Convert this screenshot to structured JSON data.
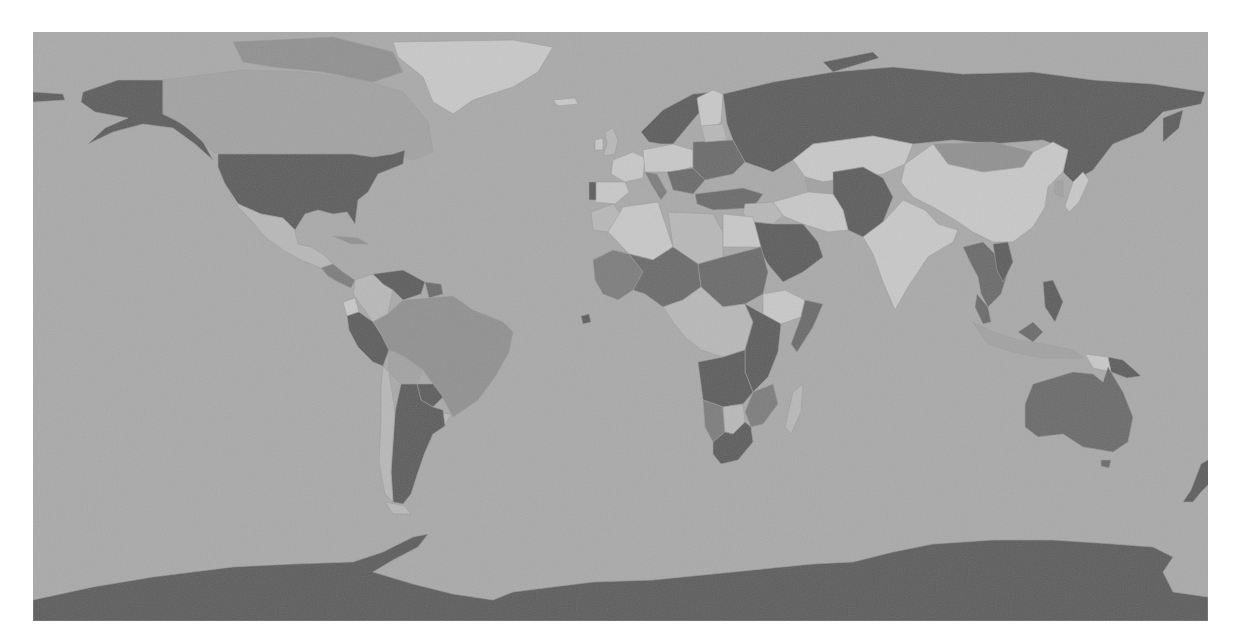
{
  "map": {
    "type": "choropleth",
    "projection": "equirectangular",
    "style": "grayscale",
    "ocean_color": "#a9a9a9",
    "shades": {
      "darkest": "#5c5c5c",
      "dark": "#6a6a6a",
      "mid_dark": "#7c7c7c",
      "mid": "#909090",
      "mid_light": "#a2a2a2",
      "light": "#b8b8b8",
      "lightest": "#c8c8c8"
    },
    "regions": [
      {
        "id": "alaska",
        "name": "Alaska (US)",
        "shade": "darkest",
        "points": "50,60 85,48 130,48 130,82 150,92 170,110 180,128 162,112 140,96 110,92 80,100 55,112 72,96 95,86 62,80 48,70"
      },
      {
        "id": "aleutians",
        "name": "Aleutian Islands",
        "shade": "darkest",
        "points": "0,60 30,62 32,68 0,70"
      },
      {
        "id": "canada",
        "name": "Canada",
        "shade": "mid_light",
        "points": "130,48 210,38 270,40 330,48 370,60 395,90 400,120 380,128 360,122 340,125 320,122 230,122 190,122 180,120 160,100 140,86 130,82"
      },
      {
        "id": "canada-arctic",
        "name": "Canadian Arctic Archipelago",
        "shade": "mid",
        "points": "200,10 300,5 360,20 370,40 340,50 290,40 240,35 210,30"
      },
      {
        "id": "greenland",
        "name": "Greenland",
        "shade": "lightest",
        "points": "360,10 480,8 520,15 505,40 480,55 440,68 420,82 400,70 390,45 365,25"
      },
      {
        "id": "iceland",
        "name": "Iceland",
        "shade": "lightest",
        "points": "520,68 542,66 545,72 525,74"
      },
      {
        "id": "usa",
        "name": "United States",
        "shade": "darkest",
        "points": "185,122 320,122 340,125 360,122 372,118 370,132 345,142 335,160 325,168 322,192 314,180 300,182 285,178 272,182 262,198 250,186 228,182 205,172 192,152 185,135"
      },
      {
        "id": "mexico",
        "name": "Mexico",
        "shade": "light",
        "points": "192,152 205,172 228,182 250,186 262,198 265,212 278,215 290,222 300,232 288,236 268,228 250,218 232,205 218,188 205,175"
      },
      {
        "id": "central-america",
        "name": "Central America",
        "shade": "mid_dark",
        "points": "288,236 300,232 310,240 322,248 318,256 305,250 295,244"
      },
      {
        "id": "cuba",
        "name": "Cuba",
        "shade": "mid",
        "points": "300,204 325,206 335,212 318,212"
      },
      {
        "id": "colombia",
        "name": "Colombia",
        "shade": "light",
        "points": "322,248 340,242 350,252 360,258 355,282 340,290 330,276 320,262"
      },
      {
        "id": "venezuela",
        "name": "Venezuela",
        "shade": "darkest",
        "points": "340,242 370,238 392,250 388,262 370,268 360,258 350,252"
      },
      {
        "id": "guyanas",
        "name": "Guyana/Suriname",
        "shade": "dark",
        "points": "392,250 408,252 410,262 396,266"
      },
      {
        "id": "ecuador",
        "name": "Ecuador",
        "shade": "lightest",
        "points": "310,270 322,266 326,280 314,284"
      },
      {
        "id": "peru",
        "name": "Peru",
        "shade": "darkest",
        "points": "314,284 326,280 340,290 348,302 356,318 350,334 340,330 325,315 316,298"
      },
      {
        "id": "brazil",
        "name": "Brazil",
        "shade": "mid",
        "points": "355,282 370,268 396,266 420,264 440,278 470,290 480,300 476,320 462,345 445,368 420,385 412,370 400,352 390,338 372,325 356,318 348,302 340,290"
      },
      {
        "id": "bolivia",
        "name": "Bolivia",
        "shade": "mid_light",
        "points": "356,318 372,325 390,338 384,352 368,352 356,340"
      },
      {
        "id": "paraguay",
        "name": "Paraguay",
        "shade": "darkest",
        "points": "384,352 400,352 410,365 400,375 388,368"
      },
      {
        "id": "uruguay",
        "name": "Uruguay",
        "shade": "light",
        "points": "402,380 418,382 412,394 402,392"
      },
      {
        "id": "argentina",
        "name": "Argentina",
        "shade": "darkest",
        "points": "368,352 384,352 388,368 400,375 410,378 412,394 400,402 392,420 385,440 378,462 370,472 360,470 358,440 360,410 362,380"
      },
      {
        "id": "chile",
        "name": "Chile",
        "shade": "light",
        "points": "350,334 356,340 362,380 360,410 358,440 360,470 352,462 346,430 348,390 348,355"
      },
      {
        "id": "tierra-del-fuego",
        "name": "Tierra del Fuego",
        "shade": "light",
        "points": "352,470 372,474 378,482 360,482"
      },
      {
        "id": "norway-sweden",
        "name": "Scandinavia",
        "shade": "darkest",
        "points": "608,100 630,78 660,62 680,60 672,74 660,88 650,100 640,112 628,112 616,110"
      },
      {
        "id": "finland",
        "name": "Finland",
        "shade": "lightest",
        "points": "664,66 680,58 690,62 688,90 676,100 668,94"
      },
      {
        "id": "uk",
        "name": "United Kingdom",
        "shade": "light",
        "points": "572,100 580,96 585,108 582,122 570,124 574,112"
      },
      {
        "id": "ireland",
        "name": "Ireland",
        "shade": "lightest",
        "points": "562,108 570,106 570,118 562,118"
      },
      {
        "id": "france",
        "name": "France",
        "shade": "lightest",
        "points": "580,128 600,120 612,126 610,146 592,150 578,142"
      },
      {
        "id": "iberia",
        "name": "Spain",
        "shade": "lightest",
        "points": "562,150 592,150 596,160 582,172 562,170"
      },
      {
        "id": "portugal",
        "name": "Portugal",
        "shade": "darkest",
        "points": "556,150 563,150 563,168 556,168"
      },
      {
        "id": "germany-poland",
        "name": "Central Europe",
        "shade": "lightest",
        "points": "610,118 640,112 660,118 660,135 640,140 612,140"
      },
      {
        "id": "italy",
        "name": "Italy",
        "shade": "mid_dark",
        "points": "612,140 624,142 634,160 628,168 618,152"
      },
      {
        "id": "balkans",
        "name": "Balkans",
        "shade": "dark",
        "points": "634,140 660,136 672,148 660,162 640,158"
      },
      {
        "id": "ukraine-belarus",
        "name": "Ukraine/Belarus",
        "shade": "dark",
        "points": "660,110 700,108 712,130 700,142 672,148 660,136"
      },
      {
        "id": "baltics",
        "name": "Baltic States",
        "shade": "light",
        "points": "668,94 690,92 694,108 672,110"
      },
      {
        "id": "turkey",
        "name": "Turkey",
        "shade": "dark",
        "points": "662,162 710,156 730,162 720,176 680,178 664,172"
      },
      {
        "id": "russia",
        "name": "Russia",
        "shade": "darkest",
        "points": "690,62 740,50 800,40 860,35 930,42 1000,40 1060,48 1120,52 1172,60 1168,72 1130,80 1110,100 1080,112 1060,138 1040,150 1030,140 1035,118 1010,108 960,112 920,108 880,112 840,104 780,112 760,128 740,140 712,130 700,108 694,92"
      },
      {
        "id": "novaya-zemlya",
        "name": "Novaya Zemlya",
        "shade": "darkest",
        "points": "790,30 840,20 846,26 800,40"
      },
      {
        "id": "kamchatka",
        "name": "Kamchatka",
        "shade": "darkest",
        "points": "1130,86 1150,78 1146,96 1130,110"
      },
      {
        "id": "kazakhstan",
        "name": "Kazakhstan",
        "shade": "lightest",
        "points": "760,128 780,112 840,104 880,112 872,132 850,142 820,146 790,150 772,145"
      },
      {
        "id": "mongolia",
        "name": "Mongolia",
        "shade": "mid",
        "points": "900,112 960,110 1000,120 990,135 950,140 915,132"
      },
      {
        "id": "china",
        "name": "China",
        "shade": "lightest",
        "points": "872,132 900,112 915,132 950,140 990,135 1000,120 1020,110 1035,118 1030,140 1015,155 1012,175 1000,195 980,210 960,210 940,200 922,188 900,175 880,165 868,150"
      },
      {
        "id": "korea",
        "name": "Korea",
        "shade": "mid_light",
        "points": "1022,150 1030,148 1030,165 1022,162"
      },
      {
        "id": "japan",
        "name": "Japan",
        "shade": "lightest",
        "points": "1040,150 1050,140 1056,148 1046,170 1036,180 1032,174"
      },
      {
        "id": "central-asia",
        "name": "Central Asia",
        "shade": "mid_light",
        "points": "772,145 790,150 820,146 830,160 812,170 790,170 775,160"
      },
      {
        "id": "afghan-pak",
        "name": "Afghanistan/Pakistan",
        "shade": "darkest",
        "points": "800,140 830,135 850,146 860,165 850,190 830,205 815,198 810,178 800,162"
      },
      {
        "id": "iran",
        "name": "Iran",
        "shade": "lightest",
        "points": "740,170 775,160 800,162 810,178 815,198 795,200 770,192 750,184"
      },
      {
        "id": "iraq-syria",
        "name": "Iraq/Syria",
        "shade": "light",
        "points": "712,172 740,170 750,184 740,192 720,190 710,182"
      },
      {
        "id": "saudi-arabia",
        "name": "Saudi Arabia",
        "shade": "darkest",
        "points": "720,190 740,192 770,192 785,210 790,225 770,240 750,250 735,232 722,210"
      },
      {
        "id": "india",
        "name": "India",
        "shade": "lightest",
        "points": "850,190 870,168 892,178 905,192 925,198 920,210 895,225 875,255 862,278 850,250 840,222 830,205"
      },
      {
        "id": "southeast-asia",
        "name": "Southeast Asia",
        "shade": "dark",
        "points": "930,215 950,210 965,225 975,240 968,262 955,275 948,262 945,245 938,232"
      },
      {
        "id": "vietnam",
        "name": "Vietnam",
        "shade": "darkest",
        "points": "960,212 975,210 980,230 970,250 964,238"
      },
      {
        "id": "malay-peninsula",
        "name": "Malaysia",
        "shade": "dark",
        "points": "944,262 955,275 958,290 950,292 942,275"
      },
      {
        "id": "indonesia",
        "name": "Indonesia",
        "shade": "mid_light",
        "points": "940,290 960,300 985,308 1010,312 1040,318 1050,326 1010,326 980,320 955,312"
      },
      {
        "id": "borneo",
        "name": "Borneo",
        "shade": "dark",
        "points": "985,300 1000,290 1010,300 1000,310"
      },
      {
        "id": "philippines",
        "name": "Philippines",
        "shade": "darkest",
        "points": "1010,250 1020,248 1030,270 1022,290 1012,275"
      },
      {
        "id": "png",
        "name": "Papua New Guinea",
        "shade": "darkest",
        "points": "1075,325 1090,328 1108,344 1094,346 1078,340"
      },
      {
        "id": "new-guinea-west",
        "name": "West Papua",
        "shade": "lightest",
        "points": "1052,322 1075,325 1078,340 1060,336"
      },
      {
        "id": "australia",
        "name": "Australia",
        "shade": "dark",
        "points": "1000,352 1040,340 1060,342 1070,350 1075,335 1090,360 1100,385 1095,410 1080,420 1050,415 1030,402 1005,405 992,395 992,372"
      },
      {
        "id": "tasmania",
        "name": "Tasmania",
        "shade": "dark",
        "points": "1068,428 1078,428 1076,436 1068,434"
      },
      {
        "id": "new-zealand",
        "name": "New Zealand",
        "shade": "darkest",
        "points": "1168,432 1180,425 1188,440 1178,450 1168,460 1160,470 1150,470 1158,458"
      },
      {
        "id": "morocco",
        "name": "Morocco",
        "shade": "light",
        "points": "558,180 580,172 590,185 575,200 560,198"
      },
      {
        "id": "algeria",
        "name": "Algeria",
        "shade": "lightest",
        "points": "590,175 625,170 635,200 640,215 620,228 596,222 580,205 575,200"
      },
      {
        "id": "libya",
        "name": "Libya",
        "shade": "light",
        "points": "635,180 680,182 690,200 690,225 665,232 640,215"
      },
      {
        "id": "egypt",
        "name": "Egypt",
        "shade": "lightest",
        "points": "690,182 720,185 728,215 690,215"
      },
      {
        "id": "west-africa",
        "name": "West Africa",
        "shade": "mid_dark",
        "points": "560,228 580,218 596,222 610,240 600,258 585,268 570,262 562,248"
      },
      {
        "id": "mali-niger",
        "name": "Sahel",
        "shade": "dark",
        "points": "596,222 620,228 640,215 665,232 668,255 650,268 630,275 612,262 600,258 610,240"
      },
      {
        "id": "chad-sudan",
        "name": "Chad/Sudan",
        "shade": "dark",
        "points": "665,232 690,225 728,215 735,240 730,262 712,272 690,275 668,255"
      },
      {
        "id": "ethiopia",
        "name": "Ethiopia",
        "shade": "lightest",
        "points": "730,262 752,258 772,268 768,285 748,292 730,282"
      },
      {
        "id": "somalia",
        "name": "Somalia",
        "shade": "dark",
        "points": "772,268 790,272 780,295 764,320 758,312 768,285"
      },
      {
        "id": "central-africa",
        "name": "Central Africa",
        "shade": "light",
        "points": "630,275 650,268 668,255 690,275 712,272 720,290 712,318 690,325 668,318 652,305 640,290"
      },
      {
        "id": "east-africa",
        "name": "East Africa",
        "shade": "darkest",
        "points": "712,272 730,282 748,292 745,320 735,345 720,360 712,340 712,318 720,290"
      },
      {
        "id": "angola-zambia",
        "name": "Angola/Zambia",
        "shade": "darkest",
        "points": "665,330 690,325 712,318 712,340 720,360 710,372 690,375 670,368"
      },
      {
        "id": "mozambique",
        "name": "Mozambique",
        "shade": "mid_dark",
        "points": "720,360 740,352 745,372 730,392 718,395 712,380"
      },
      {
        "id": "namibia",
        "name": "Namibia",
        "shade": "mid_dark",
        "points": "670,368 690,375 692,400 680,410 672,395"
      },
      {
        "id": "botswana",
        "name": "Botswana",
        "shade": "light",
        "points": "690,375 710,372 712,390 700,402 692,400"
      },
      {
        "id": "south-africa",
        "name": "South Africa",
        "shade": "darkest",
        "points": "680,410 692,400 700,402 712,390 718,395 720,410 705,428 688,432 680,422"
      },
      {
        "id": "madagascar",
        "name": "Madagascar",
        "shade": "light",
        "points": "760,360 770,352 768,380 758,402 752,395"
      },
      {
        "id": "senegal-dot",
        "name": "Senegal",
        "shade": "darkest",
        "points": "548,284 556,282 558,290 550,292"
      },
      {
        "id": "antarctica",
        "name": "Antarctica",
        "shade": "darkest",
        "points": "0,568 60,555 120,545 200,535 260,532 320,530 350,520 380,505 395,502 385,515 360,528 340,540 380,552 420,562 460,568 480,560 520,555 560,550 620,548 700,540 780,532 820,530 860,520 900,512 960,508 1020,508 1080,512 1120,515 1140,525 1130,540 1140,560 1175,565 1175,589 0,589"
      }
    ]
  }
}
